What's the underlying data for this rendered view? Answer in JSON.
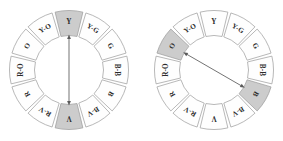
{
  "figure": {
    "name": "color-wheel-pair",
    "background_color": "#ffffff",
    "segment_fill_plain": "#fefefe",
    "segment_fill_highlight": "#cccccc",
    "segment_stroke": "#9a9a9a",
    "arrow_color": "#5a5a5a",
    "label_color": "#2b2b2b"
  },
  "segment_labels": [
    "Y",
    "Y-G",
    "G",
    "B-B",
    "B",
    "B-V",
    "V",
    "R-V",
    "R",
    "R-O",
    "O",
    "Y-O"
  ],
  "wheels": [
    {
      "id": "left",
      "name": "complementary-wheel-y-v",
      "center_x": 69,
      "center_y": 70,
      "outer_radius": 61,
      "inner_radius": 33,
      "segment_count": 12,
      "highlighted": [
        "Y",
        "V"
      ],
      "arrow": {
        "type": "double-headed",
        "from_label": "Y",
        "to_label": "V",
        "from_index": 0,
        "to_index": 6,
        "orientation": "vertical"
      },
      "labels": [
        "Y",
        "Y-G",
        "G",
        "B-B",
        "B",
        "B-V",
        "V",
        "R-V",
        "R",
        "R-O",
        "O",
        "Y-O"
      ]
    },
    {
      "id": "right",
      "name": "complementary-wheel-o-b",
      "center_x": 214,
      "center_y": 70,
      "outer_radius": 61,
      "inner_radius": 33,
      "segment_count": 12,
      "highlighted": [
        "O",
        "B"
      ],
      "arrow": {
        "type": "double-headed",
        "from_label": "O",
        "to_label": "B",
        "from_index": 10,
        "to_index": 4,
        "orientation": "diagonal"
      },
      "labels": [
        "Y",
        "Y-G",
        "G",
        "B-B",
        "B",
        "B-V",
        "V",
        "R-V",
        "R",
        "R-O",
        "O",
        "Y-O"
      ]
    }
  ]
}
